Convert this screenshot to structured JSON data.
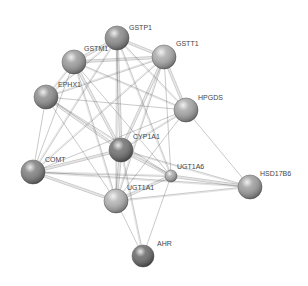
{
  "diagram": {
    "type": "protein-interaction-network",
    "nodes": [
      {
        "id": "GSTP1",
        "label": "GSTP1",
        "x": 117,
        "y": 38,
        "r": 12,
        "shade": "#8a8a8a",
        "lx": 129,
        "ly": 30
      },
      {
        "id": "GSTM1",
        "label": "GSTM1",
        "x": 74,
        "y": 62,
        "r": 12,
        "shade": "#9a9a9a",
        "lx": 84,
        "ly": 51
      },
      {
        "id": "GSTT1",
        "label": "GSTT1",
        "x": 164,
        "y": 57,
        "r": 12,
        "shade": "#aaaaaa",
        "lx": 176,
        "ly": 46
      },
      {
        "id": "EPHX1",
        "label": "EPHX1",
        "x": 46,
        "y": 97,
        "r": 12,
        "shade": "#8c8c8c",
        "lx": 58,
        "ly": 87
      },
      {
        "id": "HPGDS",
        "label": "HPGDS",
        "x": 186,
        "y": 110,
        "r": 12,
        "shade": "#a4a4a4",
        "lx": 198,
        "ly": 100
      },
      {
        "id": "CYP1A1",
        "label": "CYP1A1",
        "x": 121,
        "y": 150,
        "r": 12,
        "shade": "#6e6e6e",
        "lx": 133,
        "ly": 139
      },
      {
        "id": "UGT1A6",
        "label": "UGT1A6",
        "x": 171,
        "y": 176,
        "r": 6,
        "shade": "#a8a8a8",
        "lx": 177,
        "ly": 169
      },
      {
        "id": "COMT",
        "label": "COMT",
        "x": 33,
        "y": 172,
        "r": 12,
        "shade": "#7e7e7e",
        "lx": 45,
        "ly": 162
      },
      {
        "id": "UGT1A1",
        "label": "UGT1A1",
        "x": 116,
        "y": 201,
        "r": 12,
        "shade": "#b2b2b2",
        "lx": 127,
        "ly": 190
      },
      {
        "id": "HSD17B6",
        "label": "HSD17B6",
        "x": 250,
        "y": 187,
        "r": 12,
        "shade": "#9c9c9c",
        "lx": 260,
        "ly": 176
      },
      {
        "id": "AHR",
        "label": "AHR",
        "x": 143,
        "y": 256,
        "r": 11,
        "shade": "#666666",
        "lx": 157,
        "ly": 246
      }
    ],
    "edges": [
      {
        "from": "GSTP1",
        "to": "GSTM1",
        "w": 3
      },
      {
        "from": "GSTP1",
        "to": "GSTT1",
        "w": 3
      },
      {
        "from": "GSTP1",
        "to": "EPHX1",
        "w": 2
      },
      {
        "from": "GSTP1",
        "to": "HPGDS",
        "w": 2
      },
      {
        "from": "GSTP1",
        "to": "CYP1A1",
        "w": 3
      },
      {
        "from": "GSTP1",
        "to": "COMT",
        "w": 2
      },
      {
        "from": "GSTP1",
        "to": "UGT1A1",
        "w": 2
      },
      {
        "from": "GSTP1",
        "to": "UGT1A6",
        "w": 2
      },
      {
        "from": "GSTM1",
        "to": "GSTT1",
        "w": 3
      },
      {
        "from": "GSTM1",
        "to": "EPHX1",
        "w": 2
      },
      {
        "from": "GSTM1",
        "to": "HPGDS",
        "w": 2
      },
      {
        "from": "GSTM1",
        "to": "CYP1A1",
        "w": 3
      },
      {
        "from": "GSTM1",
        "to": "COMT",
        "w": 1
      },
      {
        "from": "GSTM1",
        "to": "UGT1A1",
        "w": 2
      },
      {
        "from": "GSTM1",
        "to": "UGT1A6",
        "w": 1
      },
      {
        "from": "GSTT1",
        "to": "EPHX1",
        "w": 2
      },
      {
        "from": "GSTT1",
        "to": "HPGDS",
        "w": 3
      },
      {
        "from": "GSTT1",
        "to": "CYP1A1",
        "w": 3
      },
      {
        "from": "GSTT1",
        "to": "COMT",
        "w": 2
      },
      {
        "from": "GSTT1",
        "to": "UGT1A1",
        "w": 2
      },
      {
        "from": "GSTT1",
        "to": "UGT1A6",
        "w": 1
      },
      {
        "from": "EPHX1",
        "to": "HPGDS",
        "w": 1
      },
      {
        "from": "EPHX1",
        "to": "CYP1A1",
        "w": 3
      },
      {
        "from": "EPHX1",
        "to": "COMT",
        "w": 1
      },
      {
        "from": "EPHX1",
        "to": "UGT1A1",
        "w": 1
      },
      {
        "from": "EPHX1",
        "to": "UGT1A6",
        "w": 2
      },
      {
        "from": "HPGDS",
        "to": "CYP1A1",
        "w": 2
      },
      {
        "from": "HPGDS",
        "to": "COMT",
        "w": 1
      },
      {
        "from": "HPGDS",
        "to": "UGT1A1",
        "w": 1
      },
      {
        "from": "HPGDS",
        "to": "HSD17B6",
        "w": 1
      },
      {
        "from": "CYP1A1",
        "to": "COMT",
        "w": 3
      },
      {
        "from": "CYP1A1",
        "to": "UGT1A1",
        "w": 3
      },
      {
        "from": "CYP1A1",
        "to": "UGT1A6",
        "w": 3
      },
      {
        "from": "CYP1A1",
        "to": "AHR",
        "w": 2
      },
      {
        "from": "CYP1A1",
        "to": "HSD17B6",
        "w": 2
      },
      {
        "from": "UGT1A6",
        "to": "UGT1A1",
        "w": 3
      },
      {
        "from": "UGT1A6",
        "to": "HSD17B6",
        "w": 3
      },
      {
        "from": "UGT1A6",
        "to": "COMT",
        "w": 2
      },
      {
        "from": "UGT1A6",
        "to": "AHR",
        "w": 1
      },
      {
        "from": "COMT",
        "to": "UGT1A1",
        "w": 3
      },
      {
        "from": "COMT",
        "to": "HSD17B6",
        "w": 2
      },
      {
        "from": "UGT1A1",
        "to": "AHR",
        "w": 1
      },
      {
        "from": "UGT1A1",
        "to": "HSD17B6",
        "w": 2
      }
    ],
    "colors": {
      "background": "#ffffff",
      "edge": "#555555",
      "label": "#444444"
    }
  }
}
